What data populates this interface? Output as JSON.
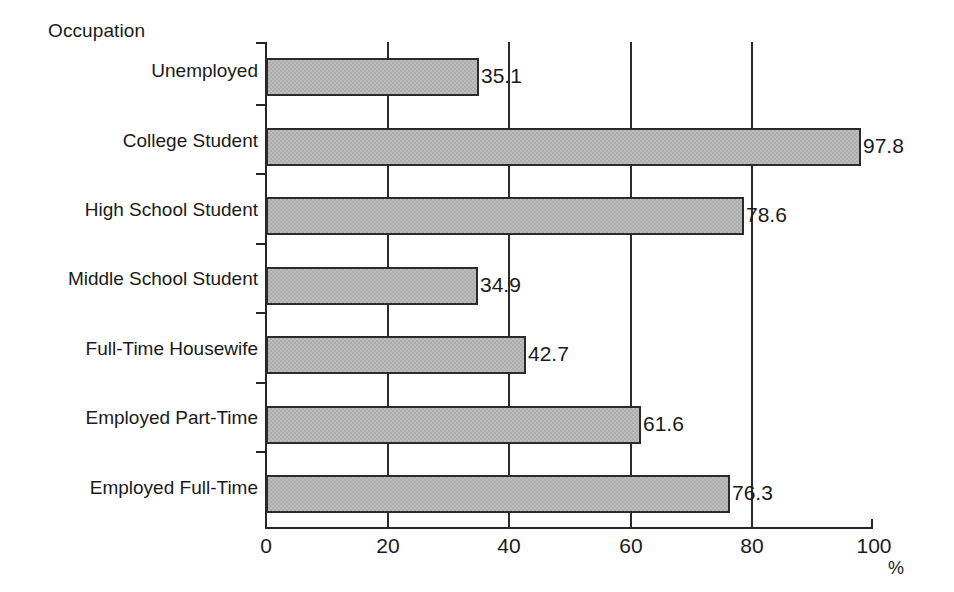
{
  "chart_data": {
    "type": "bar",
    "orientation": "horizontal",
    "title": "",
    "axis_group_label": "Occupation",
    "categories": [
      "Unemployed",
      "College Student",
      "High School Student",
      "Middle School Student",
      "Full-Time Housewife",
      "Employed Part-Time",
      "Employed Full-Time"
    ],
    "values": [
      35.1,
      97.8,
      78.6,
      34.9,
      42.7,
      61.6,
      76.3
    ],
    "value_labels": [
      "35.1",
      "97.8",
      "78.6",
      "34.9",
      "42.7",
      "61.6",
      "76.3"
    ],
    "xlabel": "%",
    "ylabel": "Occupation",
    "xlim": [
      0,
      100
    ],
    "xticks": [
      0,
      20,
      40,
      60,
      80,
      100
    ],
    "xtick_labels": [
      "0",
      "20",
      "40",
      "60",
      "80",
      "100"
    ],
    "grid": "vertical-major",
    "legend": "none",
    "bar_fill_color": "#bdbdbd",
    "bar_edge_color": "#2b2b2b",
    "axis_color": "#262626",
    "background_color": "#ffffff"
  }
}
